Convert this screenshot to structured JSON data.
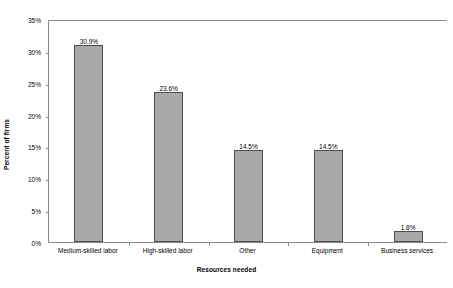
{
  "chart_data": {
    "type": "bar",
    "title": "",
    "subtitle": "",
    "xlabel": "Resources needed",
    "ylabel": "Percent of firms",
    "categories": [
      "Medium-skilled labor",
      "High-skilled labor",
      "Other",
      "Equipment",
      "Business services"
    ],
    "values": [
      30.9,
      23.6,
      14.5,
      14.5,
      1.8
    ],
    "data_labels": [
      "30.9%",
      "23.6%",
      "14.5%",
      "14.5%",
      "1.8%"
    ],
    "ylim": [
      0,
      35
    ],
    "ytick_values": [
      0,
      5,
      10,
      15,
      20,
      25,
      30,
      35
    ],
    "ytick_labels": [
      "0%",
      "5%",
      "10%",
      "15%",
      "20%",
      "25%",
      "30%",
      "35%"
    ],
    "grid": false,
    "legend": null,
    "legend_position": "none",
    "bar_fill_color": "#a9a9a9",
    "bar_border_color": "#4d4d4d",
    "axis_color": "#8a8a8a",
    "background_color": "#ffffff"
  }
}
